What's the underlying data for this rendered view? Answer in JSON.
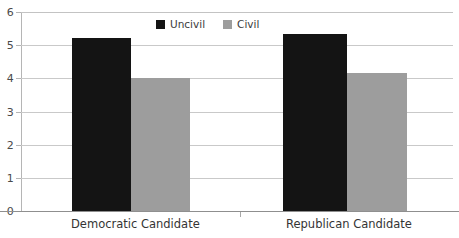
{
  "chart_data": {
    "type": "bar",
    "title": "",
    "subtitle": "",
    "xlabel": "",
    "ylabel": "",
    "categories": [
      "Democratic Candidate",
      "Republican Candidate"
    ],
    "series": [
      {
        "name": "Uncivil",
        "color": "#141414",
        "values": [
          5.22,
          5.33
        ]
      },
      {
        "name": "Civil",
        "color": "#9d9d9d",
        "values": [
          4.02,
          4.15
        ]
      }
    ],
    "ylim": [
      0,
      6
    ],
    "yticks": [
      0,
      1,
      2,
      3,
      4,
      5,
      6
    ],
    "ytick_labels": [
      "0",
      "1",
      "2",
      "3",
      "4",
      "5",
      "6"
    ],
    "grid": true,
    "grid_axis": "y",
    "legend_position": "top-center",
    "background_color": "#ffffff",
    "gridline_color": "#c9c9c9",
    "axis_color": "#8f8f8f"
  },
  "legend": {
    "entries": [
      {
        "label": "Uncivil",
        "swatch": "black-square-swatch"
      },
      {
        "label": "Civil",
        "swatch": "gray-square-swatch"
      }
    ]
  },
  "axis": {
    "y_tick_labels": [
      "6",
      "5",
      "4",
      "3",
      "2",
      "1",
      "0"
    ],
    "x_tick_labels": [
      "Democratic Candidate",
      "Republican Candidate"
    ]
  }
}
